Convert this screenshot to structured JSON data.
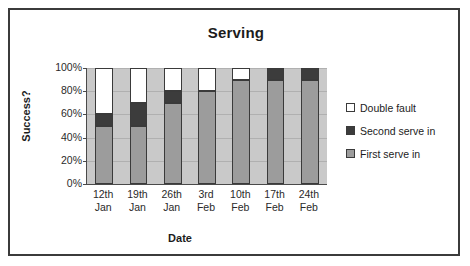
{
  "chart_data": {
    "type": "bar",
    "subtype": "stacked-100-percent",
    "title": "Serving",
    "xlabel": "Date",
    "ylabel": "Success?",
    "categories": [
      "12th\nJan",
      "19th\nJan",
      "26th\nJan",
      "3rd\nFeb",
      "10th\nFeb",
      "17th\nFeb",
      "24th\nFeb"
    ],
    "category_lines": [
      {
        "l1": "12th",
        "l2": "Jan"
      },
      {
        "l1": "19th",
        "l2": "Jan"
      },
      {
        "l1": "26th",
        "l2": "Jan"
      },
      {
        "l1": "3rd",
        "l2": "Feb"
      },
      {
        "l1": "10th",
        "l2": "Feb"
      },
      {
        "l1": "17th",
        "l2": "Feb"
      },
      {
        "l1": "24th",
        "l2": "Feb"
      }
    ],
    "series": [
      {
        "name": "First serve in",
        "color": "#9c9c9c",
        "values": [
          50,
          50,
          70,
          80,
          90,
          90,
          90
        ]
      },
      {
        "name": "Second serve in",
        "color": "#3c3c3c",
        "values": [
          10,
          20,
          10,
          0,
          0,
          10,
          10
        ]
      },
      {
        "name": "Double fault",
        "color": "#ffffff",
        "values": [
          40,
          30,
          20,
          20,
          10,
          0,
          0
        ]
      }
    ],
    "legend_order": [
      "Double fault",
      "Second serve in",
      "First serve in"
    ],
    "legend_position": "right",
    "ylim": [
      0,
      100
    ],
    "yticks": [
      "0%",
      "20%",
      "40%",
      "60%",
      "80%",
      "100%"
    ],
    "ytick_values": [
      0,
      20,
      40,
      60,
      80,
      100
    ],
    "grid": true,
    "plot_background": "#c9c9c9",
    "frame_color": "#3b3b3b"
  },
  "legend": {
    "items": [
      {
        "label": "Double fault",
        "color": "#ffffff"
      },
      {
        "label": "Second serve in",
        "color": "#3c3c3c"
      },
      {
        "label": "First serve in",
        "color": "#9c9c9c"
      }
    ]
  }
}
